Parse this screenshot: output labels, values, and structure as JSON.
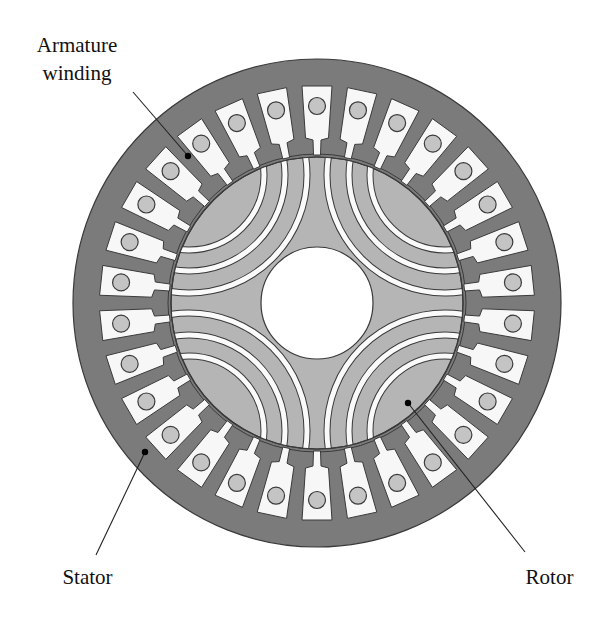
{
  "diagram": {
    "type": "motor-cross-section",
    "labels": {
      "armature_line1": "Armature",
      "armature_line2": "winding",
      "stator": "Stator",
      "rotor": "Rotor"
    },
    "geometry": {
      "center": [
        317,
        303
      ],
      "stator_outer_radius": 244,
      "stator_bore_radius": 149,
      "rotor_radius": 146,
      "shaft_radius": 56,
      "slot_count": 30,
      "first_slot_angle_deg": 90,
      "poles": 4,
      "flux_barriers_per_pole": 3,
      "barrier_center_offset": 128,
      "barrier_radii": [
        118,
        96,
        75
      ],
      "barrier_width": 5
    },
    "colors": {
      "stator": "#7b7b7b",
      "rotor": "#b5b5b5",
      "slot": "#f7f7f7",
      "conductor": "#c4c4c4",
      "outline": "#3a3a3a",
      "barrier": "#fafafa",
      "shaft": "#ffffff",
      "leader": "#222222"
    },
    "leaders": {
      "armature": {
        "from": [
          133,
          92
        ],
        "to": [
          188,
          156
        ]
      },
      "stator": {
        "from": [
          96,
          555
        ],
        "to": [
          145,
          452
        ]
      },
      "rotor": {
        "from": [
          525,
          552
        ],
        "to": [
          408,
          403
        ]
      }
    }
  }
}
